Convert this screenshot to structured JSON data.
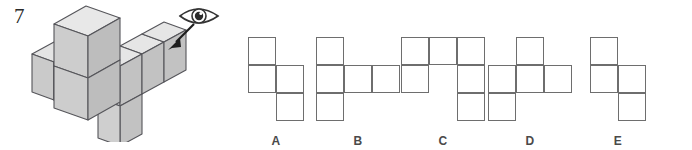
{
  "question": {
    "number": "7",
    "viewpoint_icon": "eye-icon",
    "view_arrow_icon": "arrow-down-left-icon"
  },
  "solid": {
    "name": "cube-assembly-figure",
    "description": "isometric assembly of unit cubes",
    "face_colors": {
      "top": "#e0e0e0",
      "left": "#c9c9c9",
      "right": "#b4b4b4",
      "outline": "#55555a"
    },
    "cubes": [
      {
        "x": 0,
        "y": 0,
        "z": 0
      },
      {
        "x": 1,
        "y": 0,
        "z": 0
      },
      {
        "x": 1,
        "y": 0,
        "z": 1
      },
      {
        "x": 2,
        "y": 0,
        "z": 1
      },
      {
        "x": 3,
        "y": 0,
        "z": 1
      },
      {
        "x": 3,
        "y": 0,
        "z": 0
      }
    ]
  },
  "options": [
    {
      "id": "A",
      "label": "A",
      "name": "option-a",
      "cols": 3,
      "rows": 3,
      "cells": [
        {
          "r": 0,
          "c": 0
        },
        {
          "r": 1,
          "c": 0
        },
        {
          "r": 1,
          "c": 1
        },
        {
          "r": 2,
          "c": 1
        }
      ]
    },
    {
      "id": "B",
      "label": "B",
      "name": "option-b",
      "cols": 3,
      "rows": 3,
      "cells": [
        {
          "r": 0,
          "c": 0
        },
        {
          "r": 1,
          "c": 0
        },
        {
          "r": 1,
          "c": 1
        },
        {
          "r": 1,
          "c": 2
        },
        {
          "r": 2,
          "c": 0
        }
      ]
    },
    {
      "id": "C",
      "label": "C",
      "name": "option-c",
      "cols": 3,
      "rows": 3,
      "cells": [
        {
          "r": 0,
          "c": 0
        },
        {
          "r": 0,
          "c": 1
        },
        {
          "r": 0,
          "c": 2
        },
        {
          "r": 1,
          "c": 0
        },
        {
          "r": 1,
          "c": 2
        },
        {
          "r": 2,
          "c": 2
        }
      ]
    },
    {
      "id": "D",
      "label": "D",
      "name": "option-d",
      "cols": 3,
      "rows": 3,
      "cells": [
        {
          "r": 0,
          "c": 1
        },
        {
          "r": 1,
          "c": 0
        },
        {
          "r": 1,
          "c": 1
        },
        {
          "r": 1,
          "c": 2
        },
        {
          "r": 2,
          "c": 0
        }
      ]
    },
    {
      "id": "E",
      "label": "E",
      "name": "option-e",
      "cols": 3,
      "rows": 3,
      "cells": [
        {
          "r": 0,
          "c": 0
        },
        {
          "r": 1,
          "c": 0
        },
        {
          "r": 1,
          "c": 1
        },
        {
          "r": 2,
          "c": 1
        }
      ]
    }
  ],
  "layout": {
    "option_x_positions": [
      18,
      100,
      185,
      272,
      360
    ],
    "cell_size": 28,
    "grid_stroke": "#6e6e6e"
  }
}
